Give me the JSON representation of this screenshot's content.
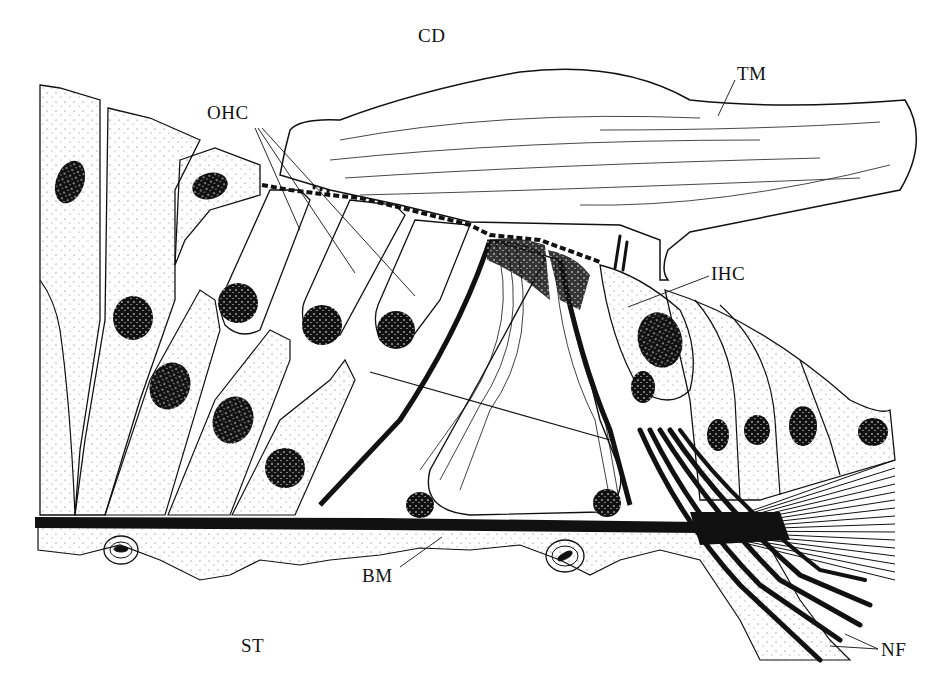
{
  "figure": {
    "type": "anatomical-line-drawing",
    "colors": {
      "ink": "#111111",
      "background": "#ffffff",
      "stipple": "#555555"
    }
  },
  "labels": {
    "cd": {
      "text": "CD",
      "x": 418,
      "y": 26
    },
    "tm": {
      "text": "TM",
      "x": 737,
      "y": 64
    },
    "ohc": {
      "text": "OHC",
      "x": 207,
      "y": 103
    },
    "ihc": {
      "text": "IHC",
      "x": 711,
      "y": 264
    },
    "bm": {
      "text": "BM",
      "x": 362,
      "y": 566
    },
    "st": {
      "text": "ST",
      "x": 241,
      "y": 636
    },
    "nf": {
      "text": "NF",
      "x": 881,
      "y": 640
    }
  }
}
